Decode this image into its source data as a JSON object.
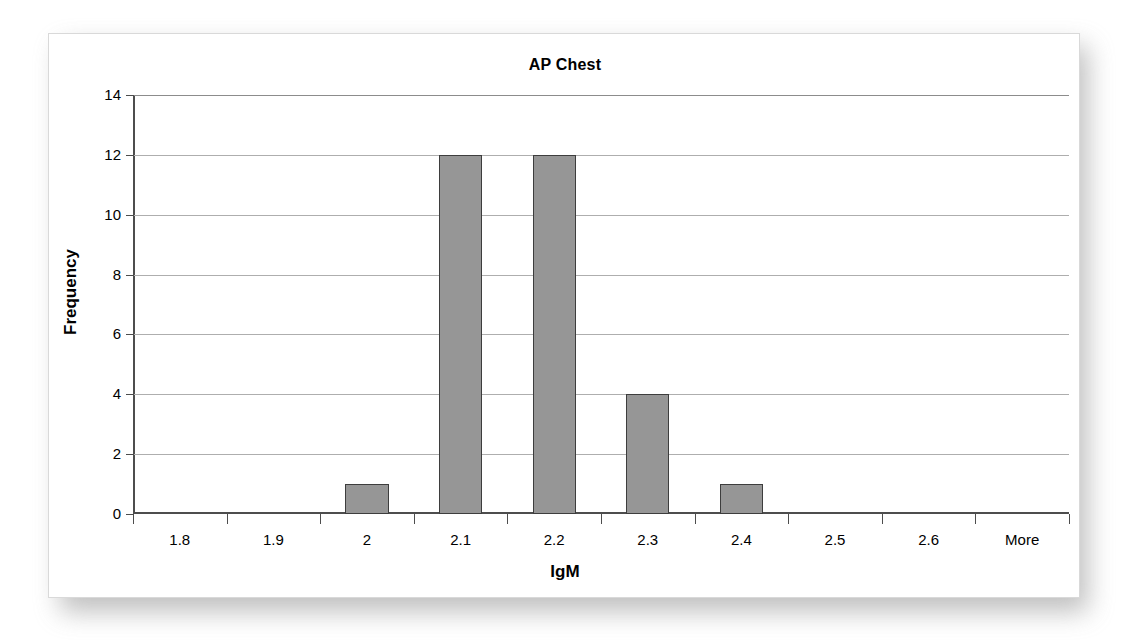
{
  "chart_data": {
    "type": "bar",
    "title": "AP Chest",
    "xlabel": "IgM",
    "ylabel": "Frequency",
    "categories": [
      "1.8",
      "1.9",
      "2",
      "2.1",
      "2.2",
      "2.3",
      "2.4",
      "2.5",
      "2.6",
      "More"
    ],
    "values": [
      0,
      0,
      1,
      12,
      12,
      4,
      1,
      0,
      0,
      0
    ],
    "ylim": [
      0,
      14
    ],
    "ytick_labels": [
      "0",
      "2",
      "4",
      "6",
      "8",
      "10",
      "12",
      "14"
    ],
    "ytick_values": [
      0,
      2,
      4,
      6,
      8,
      10,
      12,
      14
    ],
    "grid": true,
    "legend": "none",
    "bar_color": "#969696",
    "bar_border_color": "#3d3d3d",
    "gridline_color": "#aeaeae",
    "axis_color": "#4d4d4d",
    "background": "#ffffff"
  }
}
